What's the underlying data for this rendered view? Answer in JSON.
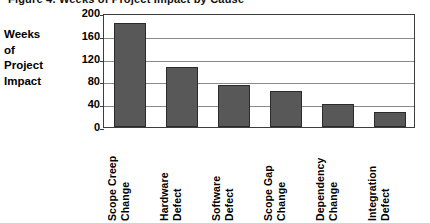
{
  "figure": {
    "clipped_title": "Figure 4. Weeks of Project Impact by Cause",
    "axis_title_lines": [
      "Weeks",
      "of",
      "Project",
      "Impact"
    ]
  },
  "chart_data": {
    "type": "bar",
    "title": "",
    "xlabel": "",
    "ylabel": "Weeks of Project Impact",
    "ylim": [
      0,
      200
    ],
    "yticks": [
      200,
      160,
      120,
      80,
      40,
      0
    ],
    "grid": true,
    "legend": "none",
    "bar_color": "#585858",
    "bar_edge_color": "#2b2b2b",
    "categories": [
      "Scope Creep Change",
      "Hardware Defect",
      "Software Defect",
      "Scope Gap Change",
      "Dependency Change",
      "Integration Defect"
    ],
    "category_lines": [
      [
        "Scope Creep",
        "Change"
      ],
      [
        "Hardware",
        "Defect"
      ],
      [
        "Software",
        "Defect"
      ],
      [
        "Scope Gap",
        "Change"
      ],
      [
        "Dependency",
        "Change"
      ],
      [
        "Integration",
        "Defect"
      ]
    ],
    "values": [
      182,
      106,
      73,
      64,
      40,
      27
    ]
  }
}
